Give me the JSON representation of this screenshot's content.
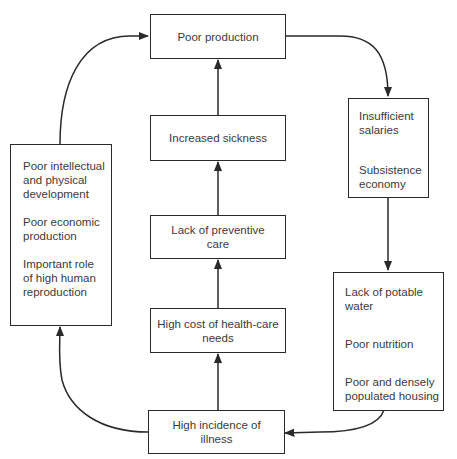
{
  "diagram": {
    "type": "cycle-flowchart",
    "nodes": {
      "poor_production": {
        "lines": [
          "Poor production"
        ]
      },
      "increased_sickness": {
        "lines": [
          "Increased sickness"
        ]
      },
      "lack_preventive_care": {
        "lines": [
          "Lack of preventive",
          "care"
        ]
      },
      "high_cost_health_care": {
        "lines": [
          "High cost of health-care",
          "needs"
        ]
      },
      "high_incidence_illness": {
        "lines": [
          "High incidence of",
          "illness"
        ]
      },
      "economic_factors": {
        "items": [
          {
            "lines": [
              "Insufficient",
              "salaries"
            ]
          },
          {
            "lines": [
              "Subsistence",
              "economy"
            ]
          }
        ]
      },
      "living_conditions": {
        "items": [
          {
            "lines": [
              "Lack of potable",
              "water"
            ]
          },
          {
            "lines": [
              "Poor nutrition"
            ]
          },
          {
            "lines": [
              "Poor and densely",
              "populated housing"
            ]
          }
        ]
      },
      "development_factors": {
        "items": [
          {
            "lines": [
              "Poor intellectual",
              "and physical",
              "development"
            ]
          },
          {
            "lines": [
              "Poor economic",
              "production"
            ]
          },
          {
            "lines": [
              "Important role",
              "of high human",
              "reproduction"
            ]
          }
        ]
      }
    },
    "edges": [
      {
        "from": "poor_production",
        "to": "economic_factors"
      },
      {
        "from": "economic_factors",
        "to": "living_conditions"
      },
      {
        "from": "living_conditions",
        "to": "high_incidence_illness"
      },
      {
        "from": "high_incidence_illness",
        "to": "high_cost_health_care"
      },
      {
        "from": "high_cost_health_care",
        "to": "lack_preventive_care"
      },
      {
        "from": "lack_preventive_care",
        "to": "increased_sickness"
      },
      {
        "from": "increased_sickness",
        "to": "poor_production"
      },
      {
        "from": "high_incidence_illness",
        "to": "development_factors"
      },
      {
        "from": "development_factors",
        "to": "poor_production"
      }
    ],
    "colors": {
      "stroke": "#2a2a2a",
      "text": "#3a3a3a",
      "background": "#ffffff"
    }
  }
}
